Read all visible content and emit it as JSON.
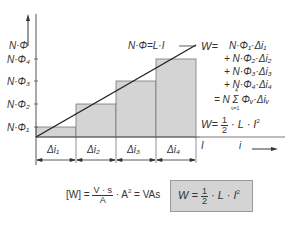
{
  "axes": {
    "y_label": "N·Φ",
    "y_ticks": [
      "N·Φ₄",
      "N·Φ₃",
      "N·Φ₂",
      "N·Φ₁"
    ],
    "x_label_I": "I",
    "x_label_i": "i"
  },
  "intervals": [
    "Δi₁",
    "Δi₂",
    "Δi₃",
    "Δi₄"
  ],
  "line_label": "N·Φ=L·I",
  "energy_sum": {
    "lead": "W=",
    "terms": [
      "N·Φ₁·Δi₁",
      "+ N·Φ₂·Δi₂",
      "+ N·Φ₃·Δi₃",
      "+ N·Φ₄·Δi₄"
    ],
    "sum": "= N Σ Φᵥ·Δiᵥ",
    "sum_upper": "4",
    "sum_lower": "v=1"
  },
  "energy_result": {
    "lead": "W=",
    "num": "1",
    "den": "2",
    "tail": "· L · I",
    "exp": "2"
  },
  "units": {
    "lhs": "[W] =",
    "num": "V · s",
    "den": "A",
    "tail": "· A",
    "exp": "2",
    "rhs": "= VAs"
  },
  "boxed_formula": {
    "lead": "W =",
    "num": "1",
    "den": "2",
    "tail": "· L · I",
    "exp": "2"
  },
  "colors": {
    "bar_fill": "#d4d4d4",
    "bar_stroke": "#777777",
    "line": "#222222",
    "box_fill": "#d4d4d4"
  }
}
